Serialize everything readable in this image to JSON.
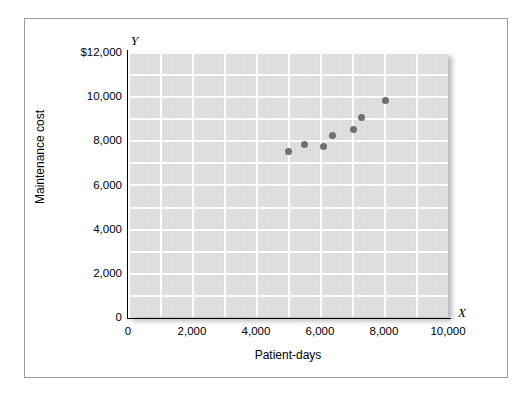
{
  "chart_data": {
    "type": "scatter",
    "title": "",
    "xlabel": "Patient-days",
    "ylabel": "Maintenance cost",
    "x_axis_name": "X",
    "y_axis_name": "Y",
    "xlim": [
      0,
      10000
    ],
    "ylim": [
      0,
      12000
    ],
    "x_ticks": [
      "0",
      "2,000",
      "4,000",
      "6,000",
      "8,000",
      "10,000"
    ],
    "x_tick_values": [
      0,
      2000,
      4000,
      6000,
      8000,
      10000
    ],
    "y_ticks": [
      "0",
      "2,000",
      "4,000",
      "6,000",
      "8,000",
      "10,000",
      "$12,000"
    ],
    "y_tick_values": [
      0,
      2000,
      4000,
      6000,
      8000,
      10000,
      12000
    ],
    "grid": true,
    "grid_step_x": 1000,
    "grid_step_y": 1000,
    "legend": "none",
    "points": [
      {
        "x": 5000,
        "y": 7500
      },
      {
        "x": 5500,
        "y": 7800
      },
      {
        "x": 6100,
        "y": 7700
      },
      {
        "x": 6400,
        "y": 8200
      },
      {
        "x": 7050,
        "y": 8500
      },
      {
        "x": 7300,
        "y": 9050
      },
      {
        "x": 8050,
        "y": 9800
      }
    ],
    "colors": {
      "point": "#6f6f6f",
      "plot_background": "#dcdcdc",
      "gridline": "#ffffff",
      "axis": "#000000",
      "frame": "#9a9a9a"
    }
  }
}
